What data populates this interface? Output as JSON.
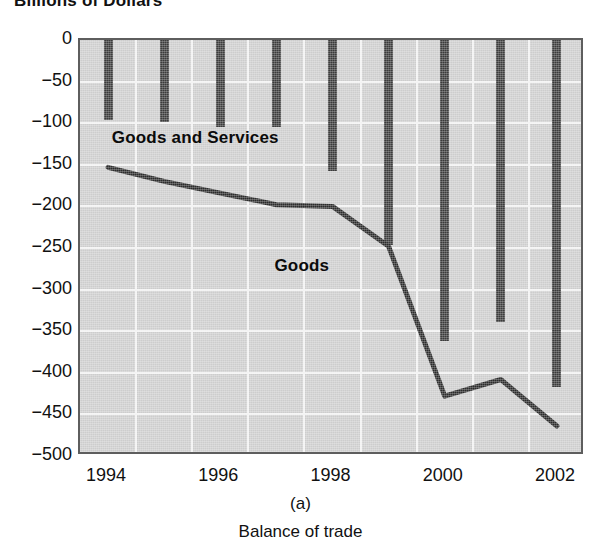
{
  "chart_data": {
    "type": "bar",
    "title": "Billions of Dollars",
    "xlabel": "",
    "ylabel": "Billions of Dollars",
    "ylim": [
      -500,
      0
    ],
    "xlim": [
      1993.5,
      2002.5
    ],
    "grid": true,
    "legend_position": "inline-annotations",
    "categories": [
      "1994",
      "1995",
      "1996",
      "1997",
      "1998",
      "1999",
      "2000",
      "2001",
      "2002"
    ],
    "x_tick_labels": [
      "1994",
      "1996",
      "1998",
      "2000",
      "2002"
    ],
    "y_tick_labels": [
      "0",
      "−50",
      "−100",
      "−150",
      "−200",
      "−250",
      "−300",
      "−350",
      "−400",
      "−450",
      "−500"
    ],
    "y_ticks": [
      0,
      -50,
      -100,
      -150,
      -200,
      -250,
      -300,
      -350,
      -400,
      -450,
      -500
    ],
    "series": [
      {
        "name": "Goods and Services",
        "type": "bar",
        "color": "#3b3b3b",
        "values": [
          -96,
          -98,
          -104,
          -105,
          -157,
          -246,
          -362,
          -339,
          -417
        ]
      },
      {
        "name": "Goods",
        "type": "line",
        "color": "#2b2b2b",
        "values": [
          -153,
          -170,
          -184,
          -198,
          -200,
          -248,
          -428,
          -408,
          -464
        ]
      }
    ],
    "annotations": [
      {
        "text": "Goods and Services",
        "x": 1994.6,
        "y": -118
      },
      {
        "text": "Goods",
        "x": 1997.5,
        "y": -272
      }
    ],
    "panel_letter": "(a)",
    "caption": "Balance of trade"
  },
  "figure": {
    "axis_title": "Billions of Dollars",
    "panel_letter": "(a)",
    "caption": "Balance of trade"
  }
}
